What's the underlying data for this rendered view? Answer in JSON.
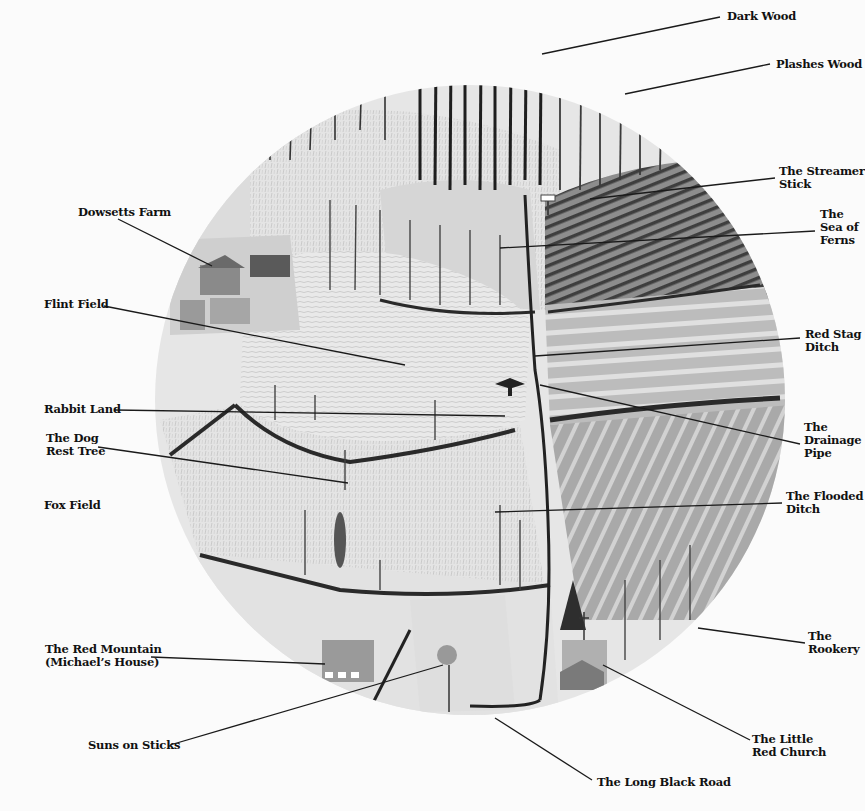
{
  "map": {
    "type": "pictorial-landscape-map",
    "style": "grayscale circular illustration",
    "circle": {
      "cx": 470,
      "cy": 400,
      "r": 315
    }
  },
  "labels": [
    {
      "id": "dark-wood",
      "text": "Dark Wood",
      "x": 727,
      "y": 10,
      "line": [
        [
          720,
          17
        ],
        [
          542,
          54
        ]
      ]
    },
    {
      "id": "plashes-wood",
      "text": "Plashes Wood",
      "x": 776,
      "y": 58,
      "line": [
        [
          770,
          64
        ],
        [
          625,
          94
        ]
      ]
    },
    {
      "id": "the-streamer-stick",
      "text": "The Streamer\nStick",
      "x": 779,
      "y": 165,
      "line": [
        [
          775,
          178
        ],
        [
          590,
          199
        ]
      ]
    },
    {
      "id": "the-sea-of-ferns",
      "text": "The\nSea of\nFerns",
      "x": 820,
      "y": 208,
      "line": [
        [
          815,
          231
        ],
        [
          500,
          248
        ]
      ]
    },
    {
      "id": "dowsetts-farm",
      "text": "Dowsetts Farm",
      "x": 78,
      "y": 206,
      "line": [
        [
          118,
          219
        ],
        [
          212,
          266
        ]
      ]
    },
    {
      "id": "flint-field",
      "text": "Flint Field",
      "x": 44,
      "y": 298,
      "line": [
        [
          104,
          306
        ],
        [
          405,
          365
        ]
      ]
    },
    {
      "id": "red-stag-ditch",
      "text": "Red Stag\nDitch",
      "x": 805,
      "y": 328,
      "line": [
        [
          800,
          338
        ],
        [
          535,
          356
        ]
      ]
    },
    {
      "id": "rabbit-land",
      "text": "Rabbit Land",
      "x": 44,
      "y": 403,
      "line": [
        [
          115,
          410
        ],
        [
          505,
          416
        ]
      ]
    },
    {
      "id": "the-drainage-pipe",
      "text": "The\nDrainage\nPipe",
      "x": 804,
      "y": 421,
      "line": [
        [
          800,
          444
        ],
        [
          540,
          385
        ]
      ]
    },
    {
      "id": "the-dog-rest-tree",
      "text": "The Dog\nRest Tree",
      "x": 46,
      "y": 432,
      "line": [
        [
          98,
          447
        ],
        [
          348,
          483
        ]
      ]
    },
    {
      "id": "fox-field",
      "text": "Fox Field",
      "x": 44,
      "y": 499,
      "line": null
    },
    {
      "id": "the-flooded-ditch",
      "text": "The Flooded\nDitch",
      "x": 786,
      "y": 490,
      "line": [
        [
          782,
          503
        ],
        [
          495,
          512
        ]
      ]
    },
    {
      "id": "the-red-mountain",
      "text": "The Red Mountain\n(Michael’s House)",
      "x": 45,
      "y": 643,
      "line": [
        [
          151,
          657
        ],
        [
          325,
          664
        ]
      ]
    },
    {
      "id": "the-rookery",
      "text": "The\nRookery",
      "x": 808,
      "y": 630,
      "line": [
        [
          805,
          643
        ],
        [
          698,
          628
        ]
      ]
    },
    {
      "id": "suns-on-sticks",
      "text": "Suns on Sticks",
      "x": 88,
      "y": 739,
      "line": [
        [
          170,
          745
        ],
        [
          443,
          665
        ]
      ]
    },
    {
      "id": "the-little-red-church",
      "text": "The Little\nRed Church",
      "x": 752,
      "y": 733,
      "line": [
        [
          750,
          740
        ],
        [
          603,
          665
        ]
      ]
    },
    {
      "id": "the-long-black-road",
      "text": "The Long Black Road",
      "x": 597,
      "y": 776,
      "line": [
        [
          592,
          780
        ],
        [
          495,
          718
        ]
      ]
    }
  ],
  "colors": {
    "background": "#fbfbfb",
    "text": "#111111",
    "leader_line": "#1a1a1a"
  }
}
